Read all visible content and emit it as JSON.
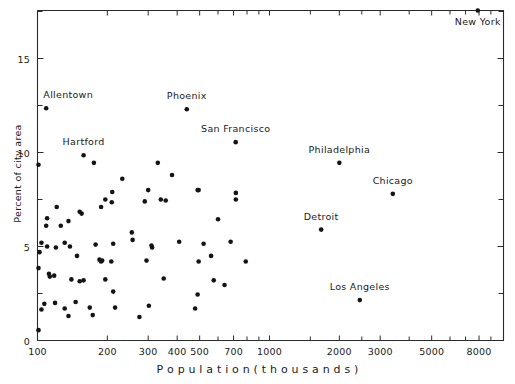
{
  "chart_data": {
    "type": "scatter",
    "title": "",
    "xlabel": "P o p u l a t i o n   ( t h o u s a n d s )",
    "ylabel": "Percent of city area",
    "xscale": "log",
    "yscale": "linear",
    "xlim": [
      95,
      9500
    ],
    "ylim": [
      0,
      18
    ],
    "grid": false,
    "legend": "none",
    "xticks": [
      100,
      200,
      300,
      400,
      500,
      700,
      1000,
      2000,
      3000,
      5000,
      8000
    ],
    "xtick_labels": [
      "100",
      "200",
      "300",
      "400",
      "500",
      "700",
      "1000",
      "2000",
      "3000",
      "5000",
      "8000"
    ],
    "xminor_ticks": [
      600,
      800,
      900,
      1500,
      2500,
      4000,
      6000,
      7000,
      9000
    ],
    "yticks": [
      0,
      5,
      10,
      15
    ],
    "ytick_labels": [
      "0",
      "5",
      "10",
      "15"
    ],
    "yminor_ticks": [
      2.5,
      7.5,
      12.5,
      17.5
    ],
    "point_color": "#141414",
    "axis_color": "#2b2b2b",
    "labeled_points": [
      {
        "label": "New York",
        "x": 7900,
        "y": 17.55,
        "dx": 0,
        "dy": 16
      },
      {
        "label": "Allentown",
        "x": 109,
        "y": 12.35,
        "dx": 22,
        "dy": -8
      },
      {
        "label": "Phoenix",
        "x": 440,
        "y": 12.3,
        "dx": 0,
        "dy": -8
      },
      {
        "label": "San Francisco",
        "x": 715,
        "y": 10.55,
        "dx": 0,
        "dy": -8
      },
      {
        "label": "Hartford",
        "x": 158,
        "y": 9.85,
        "dx": 0,
        "dy": -8
      },
      {
        "label": "Philadelphia",
        "x": 2000,
        "y": 9.45,
        "dx": 0,
        "dy": -8
      },
      {
        "label": "Chicago",
        "x": 3400,
        "y": 7.8,
        "dx": 0,
        "dy": -8
      },
      {
        "label": "Detroit",
        "x": 1670,
        "y": 5.9,
        "dx": 0,
        "dy": -8
      },
      {
        "label": "Los Angeles",
        "x": 2450,
        "y": 2.15,
        "dx": 0,
        "dy": -8
      }
    ],
    "points": [
      {
        "x": 7900,
        "y": 17.55
      },
      {
        "x": 109,
        "y": 12.35
      },
      {
        "x": 440,
        "y": 12.3
      },
      {
        "x": 715,
        "y": 10.55
      },
      {
        "x": 158,
        "y": 9.85
      },
      {
        "x": 2000,
        "y": 9.45
      },
      {
        "x": 3400,
        "y": 7.8
      },
      {
        "x": 1670,
        "y": 5.9
      },
      {
        "x": 2450,
        "y": 2.15
      },
      {
        "x": 101,
        "y": 9.35
      },
      {
        "x": 175,
        "y": 9.45
      },
      {
        "x": 330,
        "y": 9.45
      },
      {
        "x": 380,
        "y": 8.8
      },
      {
        "x": 490,
        "y": 8.0
      },
      {
        "x": 232,
        "y": 8.6
      },
      {
        "x": 300,
        "y": 8.0
      },
      {
        "x": 210,
        "y": 7.9
      },
      {
        "x": 121,
        "y": 7.1
      },
      {
        "x": 196,
        "y": 7.5
      },
      {
        "x": 209,
        "y": 7.35
      },
      {
        "x": 290,
        "y": 7.4
      },
      {
        "x": 340,
        "y": 7.5
      },
      {
        "x": 357,
        "y": 7.45
      },
      {
        "x": 495,
        "y": 8.0
      },
      {
        "x": 716,
        "y": 7.85
      },
      {
        "x": 716,
        "y": 7.5
      },
      {
        "x": 152,
        "y": 6.85
      },
      {
        "x": 188,
        "y": 7.1
      },
      {
        "x": 110,
        "y": 6.5
      },
      {
        "x": 136,
        "y": 6.35
      },
      {
        "x": 155,
        "y": 6.75
      },
      {
        "x": 109,
        "y": 6.1
      },
      {
        "x": 126,
        "y": 6.1
      },
      {
        "x": 600,
        "y": 6.45
      },
      {
        "x": 255,
        "y": 5.75
      },
      {
        "x": 104,
        "y": 5.2
      },
      {
        "x": 110,
        "y": 5.0
      },
      {
        "x": 120,
        "y": 4.95
      },
      {
        "x": 131,
        "y": 5.2
      },
      {
        "x": 138,
        "y": 5.0
      },
      {
        "x": 178,
        "y": 5.1
      },
      {
        "x": 212,
        "y": 5.15
      },
      {
        "x": 257,
        "y": 5.35
      },
      {
        "x": 310,
        "y": 5.05
      },
      {
        "x": 312,
        "y": 4.95
      },
      {
        "x": 408,
        "y": 5.25
      },
      {
        "x": 520,
        "y": 5.15
      },
      {
        "x": 680,
        "y": 5.25
      },
      {
        "x": 102,
        "y": 4.7
      },
      {
        "x": 148,
        "y": 4.5
      },
      {
        "x": 185,
        "y": 4.3
      },
      {
        "x": 188,
        "y": 4.2
      },
      {
        "x": 190,
        "y": 4.25
      },
      {
        "x": 208,
        "y": 4.2
      },
      {
        "x": 295,
        "y": 4.25
      },
      {
        "x": 495,
        "y": 4.2
      },
      {
        "x": 560,
        "y": 4.5
      },
      {
        "x": 790,
        "y": 4.2
      },
      {
        "x": 101,
        "y": 3.85
      },
      {
        "x": 112,
        "y": 3.55
      },
      {
        "x": 113,
        "y": 3.4
      },
      {
        "x": 118,
        "y": 3.45
      },
      {
        "x": 140,
        "y": 3.25
      },
      {
        "x": 152,
        "y": 3.15
      },
      {
        "x": 158,
        "y": 3.2
      },
      {
        "x": 196,
        "y": 3.25
      },
      {
        "x": 350,
        "y": 3.3
      },
      {
        "x": 575,
        "y": 3.2
      },
      {
        "x": 640,
        "y": 2.95
      },
      {
        "x": 212,
        "y": 2.6
      },
      {
        "x": 490,
        "y": 2.45
      },
      {
        "x": 107,
        "y": 1.95
      },
      {
        "x": 119,
        "y": 2.0
      },
      {
        "x": 146,
        "y": 2.05
      },
      {
        "x": 104,
        "y": 1.65
      },
      {
        "x": 131,
        "y": 1.7
      },
      {
        "x": 168,
        "y": 1.75
      },
      {
        "x": 216,
        "y": 1.75
      },
      {
        "x": 302,
        "y": 1.85
      },
      {
        "x": 478,
        "y": 1.7
      },
      {
        "x": 136,
        "y": 1.3
      },
      {
        "x": 173,
        "y": 1.35
      },
      {
        "x": 275,
        "y": 1.25
      },
      {
        "x": 101,
        "y": 0.55
      }
    ]
  }
}
